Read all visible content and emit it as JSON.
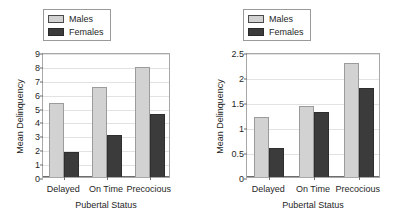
{
  "figure": {
    "panels": [
      "left",
      "right"
    ]
  },
  "legend": {
    "entries": [
      {
        "label": "Males",
        "swatch": "light-gray-swatch",
        "color": "#d2d2d2"
      },
      {
        "label": "Females",
        "swatch": "dark-gray-swatch",
        "color": "#3b3b3b"
      }
    ]
  },
  "chart_data": [
    {
      "type": "bar",
      "title": "",
      "categories": [
        "Delayed",
        "On Time",
        "Precocious"
      ],
      "series": [
        {
          "name": "Males",
          "values": [
            5.3,
            6.45,
            7.9
          ],
          "color": "#d2d2d2"
        },
        {
          "name": "Females",
          "values": [
            1.8,
            3.05,
            4.55
          ],
          "color": "#3b3b3b"
        }
      ],
      "xlabel": "Pubertal Status",
      "ylabel": "Mean Delinquency",
      "ylim": [
        0,
        9
      ],
      "yticks": [
        0,
        1,
        2,
        3,
        4,
        5,
        6,
        7,
        8,
        9
      ],
      "ytick_labels": [
        "0",
        "1",
        "2",
        "3",
        "4",
        "5",
        "6",
        "7",
        "8",
        "9"
      ],
      "grid": true,
      "legend_position": "top-left"
    },
    {
      "type": "bar",
      "title": "",
      "categories": [
        "Delayed",
        "On Time",
        "Precocious"
      ],
      "series": [
        {
          "name": "Males",
          "values": [
            1.2,
            1.42,
            2.28
          ],
          "color": "#d2d2d2"
        },
        {
          "name": "Females",
          "values": [
            0.58,
            1.31,
            1.78
          ],
          "color": "#3b3b3b"
        }
      ],
      "xlabel": "Pubertal Status",
      "ylabel": "Mean Delinquency",
      "ylim": [
        0,
        2.5
      ],
      "yticks": [
        0,
        0.5,
        1,
        1.5,
        2,
        2.5
      ],
      "ytick_labels": [
        "0",
        "0.5",
        "1",
        "1.5",
        "2",
        "2.5"
      ],
      "grid": true,
      "legend_position": "top-left"
    }
  ]
}
